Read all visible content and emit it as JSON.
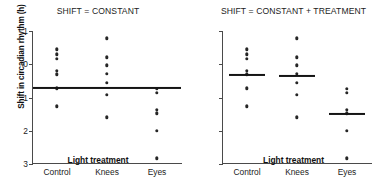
{
  "chart_data": {
    "type": "scatter",
    "ylabel": "Shift in circadian rhythm (h)",
    "xlabel": "Light treatment",
    "categories": [
      "Control",
      "Knees",
      "Eyes"
    ],
    "ytick_labels": [
      "1",
      "0",
      "1",
      "2",
      "3"
    ],
    "ytick_values": [
      -1,
      0,
      1,
      2,
      3
    ],
    "ylim": [
      -1,
      3
    ],
    "y_axis_inverted": true,
    "grid": false,
    "legend": null,
    "point_color": "#262626",
    "line_color": "#141414",
    "panels": [
      {
        "id": "panel-constant",
        "title": "SHIFT = CONSTANT",
        "model": "constant",
        "fitted_means": [
          0.7,
          0.7,
          0.7
        ],
        "mean_line_style": "single-line-across-all-groups",
        "series": [
          {
            "name": "Control",
            "values": [
              -0.45,
              -0.3,
              -0.17,
              0.2,
              0.3,
              0.72,
              1.27
            ]
          },
          {
            "name": "Knees",
            "values": [
              -0.78,
              -0.21,
              0.03,
              0.28,
              0.55,
              0.92,
              1.6
            ]
          },
          {
            "name": "Eyes",
            "values": [
              0.73,
              0.85,
              1.37,
              1.47,
              2.0,
              2.83
            ]
          }
        ]
      },
      {
        "id": "panel-constant-plus-treatment",
        "title": "SHIFT = CONSTANT + TREATMENT",
        "model": "constant + treatment",
        "fitted_means": [
          0.31,
          0.36,
          1.5
        ],
        "mean_line_style": "per-group-lines",
        "series": [
          {
            "name": "Control",
            "values": [
              -0.45,
              -0.3,
              -0.17,
              0.2,
              0.3,
              0.72,
              1.27
            ]
          },
          {
            "name": "Knees",
            "values": [
              -0.78,
              -0.21,
              0.03,
              0.28,
              0.55,
              0.92,
              1.6
            ]
          },
          {
            "name": "Eyes",
            "values": [
              0.73,
              0.85,
              1.37,
              1.47,
              2.0,
              2.83
            ]
          }
        ]
      }
    ]
  }
}
